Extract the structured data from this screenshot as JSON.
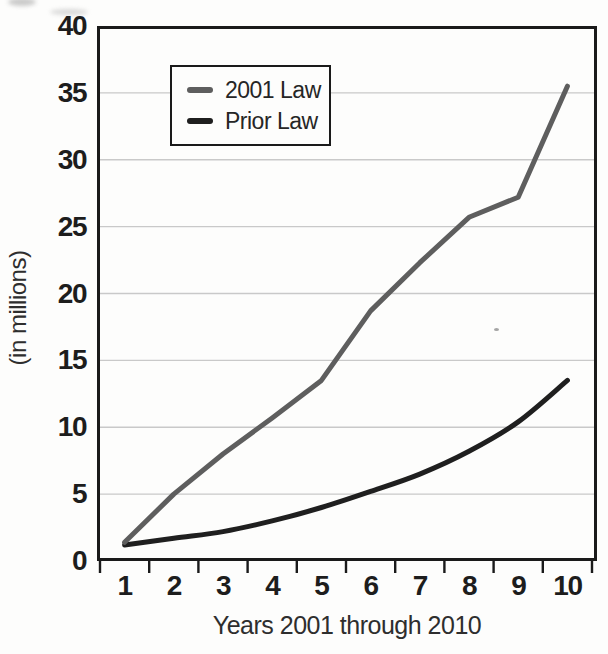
{
  "page": {
    "background": "#fdfdfc"
  },
  "style": {
    "axis_color": "#1a1a1a",
    "grid_color": "#c9c9c9",
    "text_color": "#1d1d1d"
  },
  "chart_data": {
    "type": "line",
    "title": "",
    "xlabel": "Years 2001 through 2010",
    "ylabel": "(in millions)",
    "x": [
      1,
      2,
      3,
      4,
      5,
      6,
      7,
      8,
      9,
      10
    ],
    "x_tick_labels": [
      "1",
      "2",
      "3",
      "4",
      "5",
      "6",
      "7",
      "8",
      "9",
      "10"
    ],
    "y_ticks": [
      0,
      5,
      10,
      15,
      20,
      25,
      30,
      35,
      40
    ],
    "ylim": [
      0,
      40
    ],
    "grid": "horizontal",
    "legend_position": "upper-left-inside",
    "series": [
      {
        "name": "2001 Law",
        "color": "#5e5e5e",
        "smooth": false,
        "values": [
          1.4,
          5.0,
          8.0,
          10.7,
          13.5,
          18.7,
          22.3,
          25.7,
          27.2,
          35.5
        ]
      },
      {
        "name": "Prior Law",
        "color": "#1f1f1f",
        "smooth": true,
        "values": [
          1.2,
          1.7,
          2.2,
          3.0,
          4.0,
          5.2,
          6.5,
          8.2,
          10.4,
          13.5
        ]
      }
    ]
  }
}
